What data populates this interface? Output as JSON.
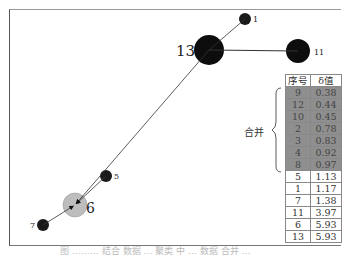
{
  "diagram": {
    "nodes": [
      {
        "id": "1",
        "label": "1",
        "x": 245,
        "y": 19,
        "r": 6,
        "fill": "#1a1a1a"
      },
      {
        "id": "13",
        "label": "13",
        "x": 209,
        "y": 50,
        "r": 15,
        "fill": "#0d0d0d"
      },
      {
        "id": "11",
        "label": "11",
        "x": 298,
        "y": 51,
        "r": 12,
        "fill": "#0d0d0d"
      },
      {
        "id": "5",
        "label": "5",
        "x": 106,
        "y": 176,
        "r": 6,
        "fill": "#1a1a1a"
      },
      {
        "id": "6",
        "label": "6",
        "x": 75,
        "y": 205,
        "r": 12,
        "fill": "#bdbdbd"
      },
      {
        "id": "7",
        "label": "7",
        "x": 43,
        "y": 225,
        "r": 6,
        "fill": "#1a1a1a"
      }
    ],
    "edges": [
      {
        "from": "13",
        "to": "1"
      },
      {
        "from": "13",
        "to": "11"
      },
      {
        "from": "13",
        "to": "6",
        "arrow": true
      },
      {
        "from": "5",
        "to": "6",
        "arrow": true
      },
      {
        "from": "7",
        "to": "6",
        "arrow": true
      }
    ]
  },
  "table": {
    "headers": [
      "序号",
      "δ值"
    ],
    "rows": [
      {
        "id": "9",
        "delta": "0.38",
        "merged": true
      },
      {
        "id": "12",
        "delta": "0.44",
        "merged": true
      },
      {
        "id": "10",
        "delta": "0.45",
        "merged": true
      },
      {
        "id": "2",
        "delta": "0.78",
        "merged": true
      },
      {
        "id": "3",
        "delta": "0.83",
        "merged": true
      },
      {
        "id": "4",
        "delta": "0.92",
        "merged": true
      },
      {
        "id": "8",
        "delta": "0.97",
        "merged": true
      },
      {
        "id": "5",
        "delta": "1.13",
        "merged": false
      },
      {
        "id": "1",
        "delta": "1.17",
        "merged": false
      },
      {
        "id": "7",
        "delta": "1.38",
        "merged": false
      },
      {
        "id": "11",
        "delta": "3.97",
        "merged": false
      },
      {
        "id": "6",
        "delta": "5.93",
        "merged": false
      },
      {
        "id": "13",
        "delta": "5.93",
        "merged": false
      }
    ]
  },
  "merge_label": "合并",
  "caption": "图 ……… 结合 数据 … 聚类 中 … 数据 合并 …"
}
